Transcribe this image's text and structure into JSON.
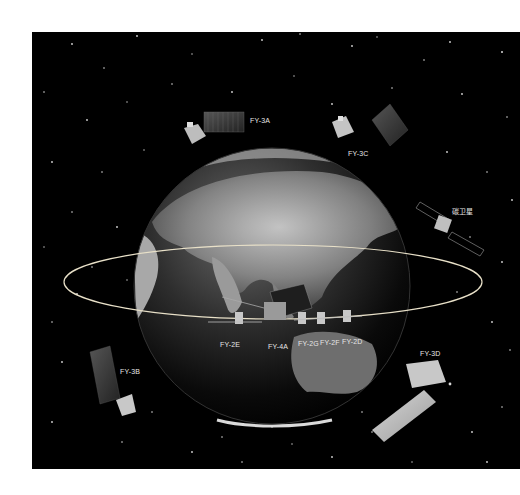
{
  "figure": {
    "background_color": "#000000",
    "orbit_color": "#e8e0c8",
    "satellites": [
      {
        "id": "fy3a",
        "label": "FY-3A"
      },
      {
        "id": "fy3c",
        "label": "FY-3C"
      },
      {
        "id": "tansat",
        "label": "碳卫星"
      },
      {
        "id": "fy2e",
        "label": "FY-2E"
      },
      {
        "id": "fy4a",
        "label": "FY-4A"
      },
      {
        "id": "fy2g",
        "label": "FY-2G"
      },
      {
        "id": "fy2f",
        "label": "FY-2F"
      },
      {
        "id": "fy2d",
        "label": "FY-2D"
      },
      {
        "id": "fy3b",
        "label": "FY-3B"
      },
      {
        "id": "fy3d",
        "label": "FY-3D"
      }
    ]
  }
}
